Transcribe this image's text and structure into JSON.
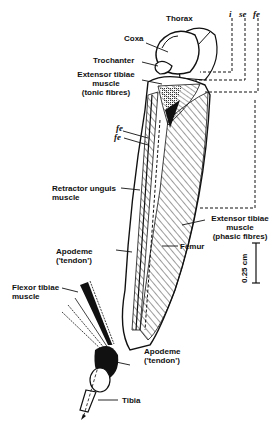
{
  "diagram": {
    "labels": {
      "thorax": "Thorax",
      "coxa": "Coxa",
      "trochanter": "Trochanter",
      "extensor_tonic_1": "Extensor tibiae",
      "extensor_tonic_2": "muscle",
      "extensor_tonic_3": "(tonic fibres)",
      "fe_a": "fe",
      "fe_b": "fe",
      "retractor_1": "Retractor unguis",
      "retractor_2": "muscle",
      "extensor_phasic_1": "Extensor tibiae",
      "extensor_phasic_2": "muscle",
      "extensor_phasic_3": "(phasic fibres)",
      "femur": "Femur",
      "apodeme_upper_1": "Apodeme",
      "apodeme_upper_2": "('tendon')",
      "flexor_1": "Flexor tibiae",
      "flexor_2": "muscle",
      "apodeme_lower_1": "Apodeme",
      "apodeme_lower_2": "('tendon')",
      "tibia": "Tibia"
    },
    "nerve_labels": [
      "i",
      "se",
      "fe"
    ],
    "scale_bar": "0.25 cm"
  }
}
